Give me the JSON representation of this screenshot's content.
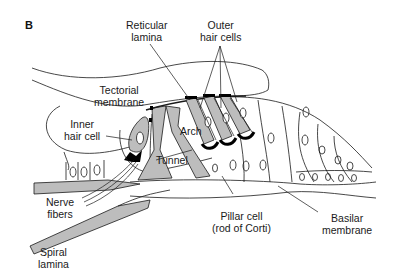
{
  "figure": {
    "panel_letter": "B",
    "colors": {
      "line": "#1a1a1a",
      "fill_gray": "#bdbdbd",
      "fill_dark": "#000000",
      "background": "#ffffff"
    }
  },
  "labels": {
    "reticular_lamina": {
      "line1": "Reticular",
      "line2": "lamina"
    },
    "outer_hair_cells": {
      "line1": "Outer",
      "line2": "hair cells"
    },
    "tectorial_membrane": {
      "line1": "Tectorial",
      "line2": "membrane"
    },
    "inner_hair_cell": {
      "line1": "Inner",
      "line2": "hair cell"
    },
    "arch": {
      "line1": "Arch"
    },
    "tunnel": {
      "line1": "Tunnel"
    },
    "nerve_fibers": {
      "line1": "Nerve",
      "line2": "fibers"
    },
    "pillar_cell": {
      "line1": "Pillar cell",
      "line2": "(rod of Corti)"
    },
    "basilar_membrane": {
      "line1": "Basilar",
      "line2": "membrane"
    },
    "spiral_lamina": {
      "line1": "Spiral",
      "line2": "lamina"
    }
  }
}
